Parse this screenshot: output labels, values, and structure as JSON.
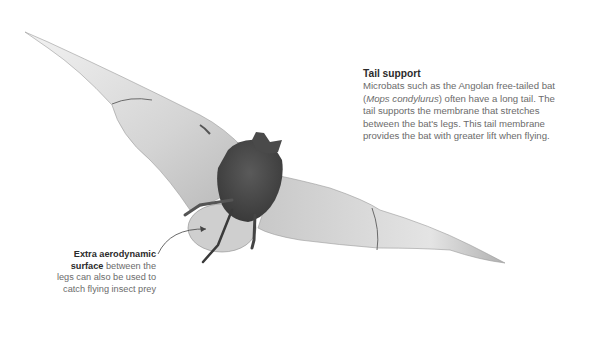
{
  "illustration": {
    "subject": "Angolan free-tailed bat in flight, viewed from below/behind",
    "colors": {
      "background": "#ffffff",
      "wing": "#d8d8d8",
      "body": "#4a4a4a",
      "text_heading": "#2b2b2b",
      "text_body": "#6b6b6b"
    }
  },
  "annotations": {
    "tail_support": {
      "title": "Tail support",
      "line1": "Microbats such as the Angolan free-tailed bat",
      "species_open": "(",
      "species": "Mops condylurus",
      "line2_rest": ") often have a long tail. The",
      "line3": "tail supports the membrane that stretches",
      "line4": "between the bat's legs. This tail membrane",
      "line5": "provides the bat with greater lift when flying."
    },
    "membrane": {
      "bold1": "Extra aerodynamic",
      "bold2": "surface",
      "rest2": " between the",
      "line3": "legs can also be used to",
      "line4": "catch flying insect prey"
    }
  }
}
